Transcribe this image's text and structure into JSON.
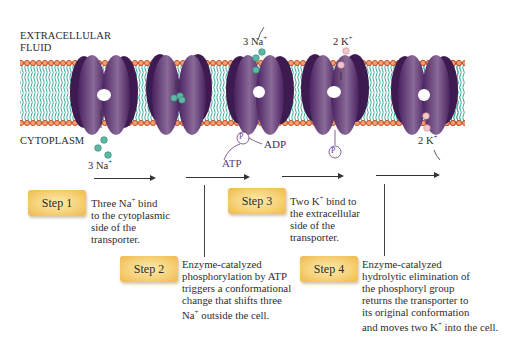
{
  "diagram": {
    "regions": {
      "extracellular": "EXTRACELLULAR\nFLUID",
      "cytoplasm": "CYTOPLASM"
    },
    "ion_labels": {
      "na_in": "3 Na",
      "na_out": "3 Na",
      "k_in_top": "2 K",
      "k_out_bottom": "2 K",
      "charge": "+"
    },
    "molecules": {
      "atp": "ATP",
      "adp": "ADP",
      "phosphate": "P"
    },
    "steps": [
      {
        "label": "Step 1",
        "desc_pre": "Three Na",
        "desc_sup": "+",
        "desc_post": " bind\nto the cytoplasmic\nside of the\ntransporter."
      },
      {
        "label": "Step 2",
        "desc_pre": "Enzyme-catalyzed\nphosphorylation by ATP\ntriggers a conformational\nchange that shifts three\nNa",
        "desc_sup": "+",
        "desc_post": " outside the cell."
      },
      {
        "label": "Step 3",
        "desc_pre": "Two K",
        "desc_sup": "+",
        "desc_post": " bind to\nthe extracellular\nside of the\ntransporter."
      },
      {
        "label": "Step 4",
        "desc_pre": "Enzyme-catalyzed\nhydrolytic elimination of\nthe phosphoryl group\nreturns the transporter to\nits original conformation\nand moves two K",
        "desc_sup": "+",
        "desc_post": " into the cell."
      }
    ],
    "colors": {
      "protein": "#5b2e6e",
      "protein_dark": "#3d1a4f",
      "lipid_head": "#d9643a",
      "lipid_tail": "#3aa89a",
      "na_ion": "#5fb8a3",
      "k_ion": "#e8b5bd",
      "step_box": "#f4cc6c"
    }
  }
}
